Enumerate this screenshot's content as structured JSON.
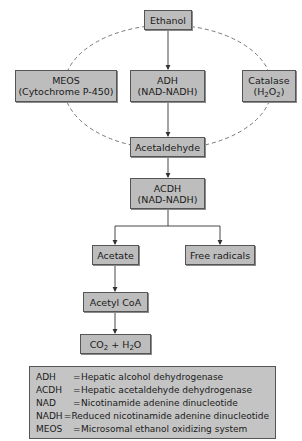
{
  "diagram": {
    "nodes": {
      "ethanol": {
        "label": "Ethanol"
      },
      "meos": {
        "line1": "MEOS",
        "line2": "(Cytochrome P-450)"
      },
      "adh": {
        "line1": "ADH",
        "line2": "(NAD-NADH)"
      },
      "catalase": {
        "line1": "Catalase",
        "line2_pre": "(H",
        "line2_sub1": "2",
        "line2_mid": "O",
        "line2_sub2": "2",
        "line2_post": ")"
      },
      "acetaldehyde": {
        "label": "Acetaldehyde"
      },
      "acdh": {
        "line1": "ACDH",
        "line2": "(NAD-NADH)"
      },
      "acetate": {
        "label": "Acetate"
      },
      "free_radicals": {
        "label": "Free radicals"
      },
      "acetyl_coa": {
        "label": "Acetyl CoA"
      },
      "co2_h2o": {
        "pre": "CO",
        "sub1": "2",
        "mid": " + H",
        "sub2": "2",
        "post": "O"
      }
    },
    "edges": [
      {
        "from": "Ethanol",
        "to": "ADH",
        "style": "solid-arrow"
      },
      {
        "from": "ADH",
        "to": "Acetaldehyde",
        "style": "solid-arrow"
      },
      {
        "from": "Ethanol",
        "to": "MEOS",
        "style": "dashed"
      },
      {
        "from": "Ethanol",
        "to": "Catalase",
        "style": "dashed"
      },
      {
        "from": "MEOS",
        "to": "Acetaldehyde",
        "style": "dashed"
      },
      {
        "from": "Catalase",
        "to": "Acetaldehyde",
        "style": "dashed"
      },
      {
        "from": "Acetaldehyde",
        "to": "ACDH",
        "style": "solid-arrow"
      },
      {
        "from": "ACDH",
        "to": "Acetate",
        "style": "solid-arrow"
      },
      {
        "from": "ACDH",
        "to": "Free radicals",
        "style": "solid-arrow"
      },
      {
        "from": "Acetate",
        "to": "Acetyl CoA",
        "style": "solid-arrow"
      },
      {
        "from": "Acetyl CoA",
        "to": "CO2 + H2O",
        "style": "solid-arrow"
      }
    ],
    "legend": [
      {
        "abbr": "ADH",
        "eq": "=",
        "text": "Hepatic alcohol dehydrogenase"
      },
      {
        "abbr": "ACDH",
        "eq": "=",
        "text": "Hepatic acetaldehyde dehydrogenase"
      },
      {
        "abbr": "NAD",
        "eq": "=",
        "text": "Nicotinamide adenine dinucleotide"
      },
      {
        "abbr": "NADH",
        "eq": "=",
        "text": "Reduced nicotinamide adenine dinucleotide"
      },
      {
        "abbr": "MEOS",
        "eq": "=",
        "text": "Microsomal ethanol oxidizing system"
      }
    ],
    "colors": {
      "box_fill": "#bdbdbd",
      "border": "#555555",
      "line": "#333333"
    }
  }
}
